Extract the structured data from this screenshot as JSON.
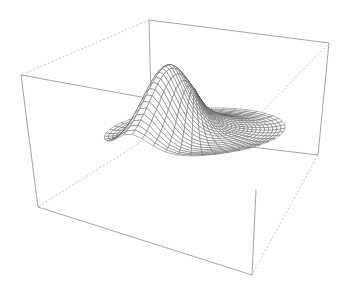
{
  "figure": {
    "type": "3d-wireframe-surface",
    "width": 345,
    "height": 295,
    "background": "#ffffff",
    "line_color": "#555555",
    "box_color": "#8a8a8a"
  },
  "box": {
    "corners": {
      "top_back_left": [
        149,
        20
      ],
      "top_left": [
        21,
        75
      ],
      "top_right": [
        329,
        43
      ],
      "top_front": [
        256,
        118
      ],
      "bottom_back": [
        152,
        135
      ],
      "bottom_left": [
        38,
        207
      ],
      "bottom_right": [
        318,
        155
      ],
      "bottom_front": [
        252,
        275
      ]
    }
  },
  "surface": {
    "description": "Radial ripple surface with a single sharp peak",
    "grid_u": 22,
    "grid_v": 22,
    "peak_screen": [
      217,
      65
    ]
  }
}
